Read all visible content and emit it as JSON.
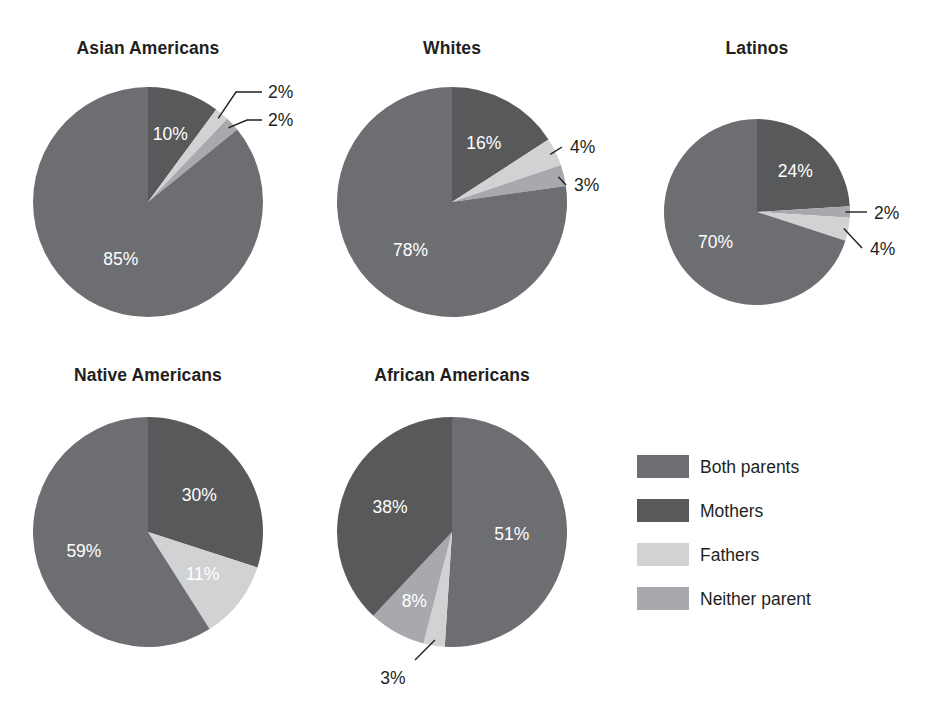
{
  "figure": {
    "background": "#ffffff",
    "text_color": "#231f20",
    "inner_label_color": "#ffffff"
  },
  "series_colors": {
    "both_parents": "#6d6e71",
    "mothers": "#58595b",
    "fathers": "#d0d2d3",
    "neither_parent": "#a7a9ac"
  },
  "legend": {
    "position": "bottom-right",
    "items": [
      {
        "key": "both_parents",
        "label": "Both parents",
        "color": "#6d6e71"
      },
      {
        "key": "mothers",
        "label": "Mothers",
        "color": "#58595b"
      },
      {
        "key": "fathers",
        "label": "Fathers",
        "color": "#d0d2d3"
      },
      {
        "key": "neither_parent",
        "label": "Neither parent",
        "color": "#a7a9ac"
      }
    ]
  },
  "chart_data": [
    {
      "type": "pie",
      "title": "Asian Americans",
      "center": [
        148,
        202
      ],
      "radius": 115,
      "start_angle": 0,
      "direction": "clockwise",
      "categories": [
        "Mothers",
        "Fathers",
        "Neither parent",
        "Both parents"
      ],
      "values": [
        10,
        2,
        2,
        85
      ],
      "slices": [
        {
          "key": "mothers",
          "label": "10%",
          "value": 10,
          "color": "#58595b",
          "label_placement": "inside",
          "label_r": 0.62
        },
        {
          "key": "fathers",
          "label": "2%",
          "value": 2,
          "color": "#d0d2d3",
          "label_placement": "callout",
          "callout": {
            "elbow": [
              236,
              92
            ],
            "end": [
              262,
              92
            ],
            "text": [
              268,
              98
            ]
          }
        },
        {
          "key": "neither_parent",
          "label": "2%",
          "value": 2,
          "color": "#a7a9ac",
          "label_placement": "callout",
          "callout": {
            "elbow": [
              247,
              120
            ],
            "end": [
              262,
              120
            ],
            "text": [
              268,
              126
            ]
          }
        },
        {
          "key": "both_parents",
          "label": "85%",
          "value": 85,
          "color": "#6d6e71",
          "label_placement": "inside",
          "label_r": 0.55
        }
      ]
    },
    {
      "type": "pie",
      "title": "Whites",
      "center": [
        452,
        202
      ],
      "radius": 115,
      "start_angle": 0,
      "direction": "clockwise",
      "categories": [
        "Mothers",
        "Fathers",
        "Neither parent",
        "Both parents"
      ],
      "values": [
        16,
        4,
        3,
        78
      ],
      "slices": [
        {
          "key": "mothers",
          "label": "16%",
          "value": 16,
          "color": "#58595b",
          "label_placement": "inside",
          "label_r": 0.58
        },
        {
          "key": "fathers",
          "label": "4%",
          "value": 4,
          "color": "#d0d2d3",
          "label_placement": "callout",
          "callout": {
            "elbow": null,
            "end": [
              562,
              147
            ],
            "text": [
              570,
              153
            ]
          }
        },
        {
          "key": "neither_parent",
          "label": "3%",
          "value": 3,
          "color": "#a7a9ac",
          "label_placement": "callout",
          "callout": {
            "elbow": null,
            "end": [
              566,
              185
            ],
            "text": [
              574,
              191
            ]
          }
        },
        {
          "key": "both_parents",
          "label": "78%",
          "value": 78,
          "color": "#6d6e71",
          "label_placement": "inside",
          "label_r": 0.55
        }
      ]
    },
    {
      "type": "pie",
      "title": "Latinos",
      "center": [
        757,
        212
      ],
      "radius": 93,
      "start_angle": 0,
      "direction": "clockwise",
      "categories": [
        "Mothers",
        "Neither parent",
        "Fathers",
        "Both parents"
      ],
      "values": [
        24,
        2,
        4,
        70
      ],
      "slices": [
        {
          "key": "mothers",
          "label": "24%",
          "value": 24,
          "color": "#58595b",
          "label_placement": "inside",
          "label_r": 0.6
        },
        {
          "key": "neither_parent",
          "label": "2%",
          "value": 2,
          "color": "#a7a9ac",
          "label_placement": "callout",
          "callout": {
            "elbow": null,
            "end": [
              867,
              212
            ],
            "text": [
              874,
              219
            ]
          }
        },
        {
          "key": "fathers",
          "label": "4%",
          "value": 4,
          "color": "#d0d2d3",
          "label_placement": "callout",
          "callout": {
            "elbow": null,
            "end": [
              862,
              248
            ],
            "text": [
              870,
              255
            ]
          }
        },
        {
          "key": "both_parents",
          "label": "70%",
          "value": 70,
          "color": "#6d6e71",
          "label_placement": "inside",
          "label_r": 0.55
        }
      ]
    },
    {
      "type": "pie",
      "title": "Native Americans",
      "center": [
        148,
        532
      ],
      "radius": 115,
      "start_angle": 0,
      "direction": "clockwise",
      "categories": [
        "Mothers",
        "Fathers",
        "Both parents"
      ],
      "values": [
        30,
        11,
        59
      ],
      "slices": [
        {
          "key": "mothers",
          "label": "30%",
          "value": 30,
          "color": "#58595b",
          "label_placement": "inside",
          "label_r": 0.55
        },
        {
          "key": "fathers",
          "label": "11%",
          "value": 11,
          "color": "#d0d2d3",
          "label_placement": "inside",
          "label_r": 0.6,
          "label_color": "#231f20"
        },
        {
          "key": "both_parents",
          "label": "59%",
          "value": 59,
          "color": "#6d6e71",
          "label_placement": "inside",
          "label_r": 0.58
        }
      ]
    },
    {
      "type": "pie",
      "title": "African Americans",
      "center": [
        452,
        532
      ],
      "radius": 115,
      "start_angle": 0,
      "direction": "clockwise",
      "categories": [
        "Both parents",
        "Neither parent",
        "Fathers",
        "Mothers"
      ],
      "values": [
        51,
        3,
        8,
        38
      ],
      "slices": [
        {
          "key": "both_parents",
          "label": "51%",
          "value": 51,
          "color": "#6d6e71",
          "label_placement": "inside",
          "label_r": 0.52
        },
        {
          "key": "neither_parent",
          "label": "3%",
          "value": 3,
          "color": "#d0d2d3",
          "label_placement": "callout",
          "callout": {
            "elbow": null,
            "end": [
              415,
              660
            ],
            "text": [
              393,
              684
            ]
          }
        },
        {
          "key": "fathers",
          "label": "8%",
          "value": 8,
          "color": "#a7a9ac",
          "label_placement": "inside",
          "label_r": 0.68,
          "label_color": "#231f20"
        },
        {
          "key": "mothers",
          "label": "38%",
          "value": 38,
          "color": "#58595b",
          "label_placement": "inside",
          "label_r": 0.58
        }
      ]
    }
  ],
  "titles_layout": [
    {
      "text": "Asian Americans",
      "x": 148,
      "y": 54
    },
    {
      "text": "Whites",
      "x": 452,
      "y": 54
    },
    {
      "text": "Latinos",
      "x": 757,
      "y": 54
    },
    {
      "text": "Native Americans",
      "x": 148,
      "y": 381
    },
    {
      "text": "African Americans",
      "x": 452,
      "y": 381
    }
  ],
  "legend_layout": {
    "swatch_x": 637,
    "text_x": 700,
    "first_y": 455,
    "row_step": 44,
    "swatch_w": 52,
    "swatch_h": 23
  }
}
